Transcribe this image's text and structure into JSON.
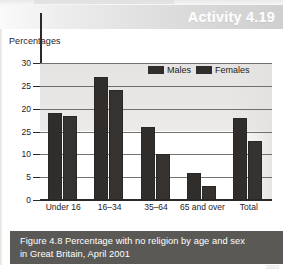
{
  "header": {
    "activity_title": "Activity 4.19"
  },
  "axis_caption": "Percentages",
  "caption": {
    "line1": "Figure 4.8 Percentage with no religion by age and sex",
    "line2": "in Great Britain, April 2001"
  },
  "source_strip": "2003",
  "colors": {
    "bar": "#302d2b",
    "caption_box": "#5b5955",
    "header_band": "#dedede",
    "header_text": "#ffffff",
    "gridline": "#5d5a57"
  },
  "chart_data": {
    "type": "bar",
    "title": "Figure 4.8 Percentage with no religion by age and sex in Great Britain, April 2001",
    "xlabel": "",
    "ylabel": "Percentages",
    "ylim": [
      0,
      30
    ],
    "yticks": [
      0,
      5,
      10,
      15,
      20,
      25,
      30
    ],
    "ytick_labels": [
      "0",
      "5",
      "10",
      "25",
      "20",
      "25",
      "30"
    ],
    "grid": true,
    "legend_position": "top-right",
    "categories": [
      "Under 16",
      "16–34",
      "35–64",
      "65 and over",
      "Total"
    ],
    "series": [
      {
        "name": "Males",
        "values": [
          19,
          27,
          16,
          6,
          18
        ]
      },
      {
        "name": "Females",
        "values": [
          18.5,
          24,
          10,
          3,
          13
        ]
      }
    ]
  }
}
